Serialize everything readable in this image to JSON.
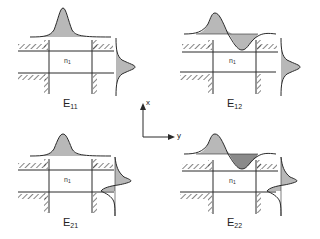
{
  "diagram": {
    "panels": [
      {
        "id": "E11",
        "label_main": "E",
        "label_sub": "11",
        "core_label_main": "n",
        "core_label_sub": "1"
      },
      {
        "id": "E12",
        "label_main": "E",
        "label_sub": "12",
        "core_label_main": "n",
        "core_label_sub": "1"
      },
      {
        "id": "E21",
        "label_main": "E",
        "label_sub": "21",
        "core_label_main": "n",
        "core_label_sub": "1"
      },
      {
        "id": "E22",
        "label_main": "E",
        "label_sub": "22",
        "core_label_main": "n",
        "core_label_sub": "1"
      }
    ],
    "axes": {
      "x_label": "x",
      "y_label": "y"
    },
    "colors": {
      "line": "#2a2a2a",
      "fill_light": "#b8b8b8",
      "fill_dark": "#8a8a8a"
    }
  }
}
